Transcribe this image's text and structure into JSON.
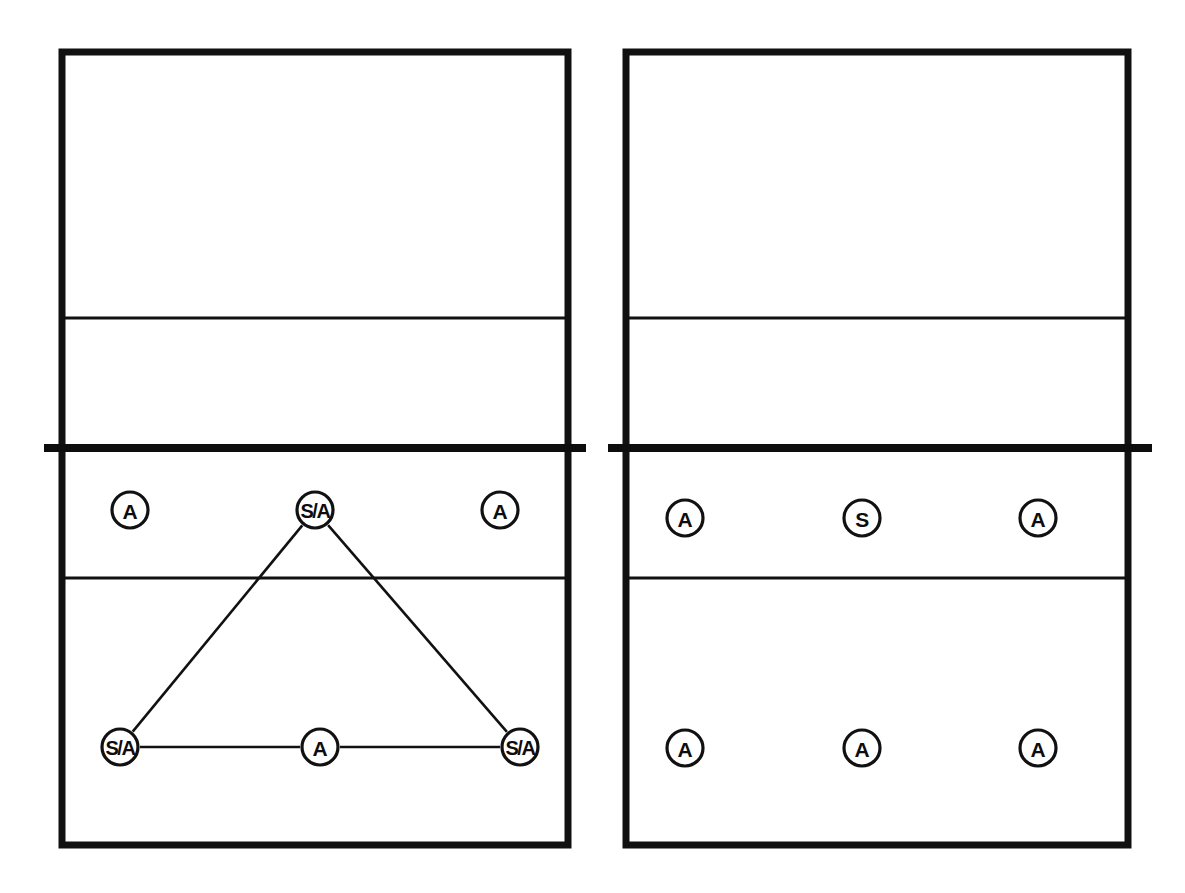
{
  "diagram": {
    "line_color": "#111111",
    "fill_color": "#ffffff",
    "courts": [
      {
        "id": "left-court",
        "name": "left-court",
        "bounds": {
          "x": 62,
          "y": 52,
          "width": 506,
          "height": 793
        },
        "attack_lines_y": [
          318,
          578
        ],
        "net": {
          "y": 448,
          "x1": 44,
          "x2": 586
        },
        "players": [
          {
            "id": "lc-p1",
            "label": "A",
            "x": 130,
            "y": 510,
            "role": "attacker"
          },
          {
            "id": "lc-p2",
            "label": "S/A",
            "x": 315,
            "y": 510,
            "role": "setter-attacker"
          },
          {
            "id": "lc-p3",
            "label": "A",
            "x": 500,
            "y": 510,
            "role": "attacker"
          },
          {
            "id": "lc-p4",
            "label": "S/A",
            "x": 120,
            "y": 747,
            "role": "setter-attacker"
          },
          {
            "id": "lc-p5",
            "label": "A",
            "x": 320,
            "y": 747,
            "role": "attacker"
          },
          {
            "id": "lc-p6",
            "label": "S/A",
            "x": 520,
            "y": 747,
            "role": "setter-attacker"
          }
        ],
        "connections": [
          {
            "from": "lc-p2",
            "to": "lc-p4",
            "name": "link-front-setter-to-left-back"
          },
          {
            "from": "lc-p2",
            "to": "lc-p6",
            "name": "link-front-setter-to-right-back"
          },
          {
            "from": "lc-p4",
            "to": "lc-p5",
            "name": "link-left-back-to-middle-back"
          },
          {
            "from": "lc-p5",
            "to": "lc-p6",
            "name": "link-middle-back-to-right-back"
          }
        ]
      },
      {
        "id": "right-court",
        "name": "right-court",
        "bounds": {
          "x": 626,
          "y": 52,
          "width": 502,
          "height": 793
        },
        "attack_lines_y": [
          318,
          578
        ],
        "net": {
          "y": 448,
          "x1": 608,
          "x2": 1152
        },
        "players": [
          {
            "id": "rc-p1",
            "label": "A",
            "x": 685,
            "y": 518,
            "role": "attacker"
          },
          {
            "id": "rc-p2",
            "label": "S",
            "x": 862,
            "y": 518,
            "role": "setter"
          },
          {
            "id": "rc-p3",
            "label": "A",
            "x": 1038,
            "y": 518,
            "role": "attacker"
          },
          {
            "id": "rc-p4",
            "label": "A",
            "x": 685,
            "y": 748,
            "role": "attacker"
          },
          {
            "id": "rc-p5",
            "label": "A",
            "x": 862,
            "y": 748,
            "role": "attacker"
          },
          {
            "id": "rc-p6",
            "label": "A",
            "x": 1038,
            "y": 748,
            "role": "attacker"
          }
        ],
        "connections": []
      }
    ],
    "marker": {
      "radius": 18,
      "stroke_width": 3.2
    },
    "legend_keys": [
      {
        "code": "A",
        "meaning": "A"
      },
      {
        "code": "S",
        "meaning": "S"
      },
      {
        "code": "S/A",
        "meaning": "S/A"
      }
    ]
  }
}
